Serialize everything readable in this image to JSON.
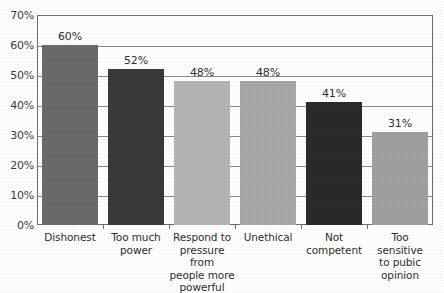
{
  "chart_data": {
    "type": "bar",
    "title": "",
    "xlabel": "",
    "ylabel": "",
    "ylim": [
      0,
      70
    ],
    "ytick_step": 10,
    "ytick_labels": [
      "0%",
      "10%",
      "20%",
      "30%",
      "40%",
      "50%",
      "60%",
      "70%"
    ],
    "ytick_values": [
      0,
      10,
      20,
      30,
      40,
      50,
      60,
      70
    ],
    "grid": true,
    "legend": "none",
    "value_label_suffix": "%",
    "categories": [
      "Dishonest",
      "Too much power",
      "Respond to pressure from people more powerful",
      "Unethical",
      "Not competent",
      "Too sensitive to pubic opinion"
    ],
    "category_lines": [
      [
        "Dishonest"
      ],
      [
        "Too much",
        "power"
      ],
      [
        "Respond to",
        "pressure from",
        "people more",
        "powerful"
      ],
      [
        "Unethical"
      ],
      [
        "Not",
        "competent"
      ],
      [
        "Too sensitive",
        "to pubic",
        "opinion"
      ]
    ],
    "values": [
      60,
      52,
      48,
      48,
      41,
      31
    ],
    "value_labels": [
      "60%",
      "52%",
      "48%",
      "48%",
      "41%",
      "31%"
    ],
    "bar_colors": [
      "#6b6b6b",
      "#3a3a3a",
      "#b5b5b5",
      "#a8a8a8",
      "#2b2b2b",
      "#a0a0a0"
    ],
    "axis_color": "#6e6e6e",
    "gridline_color": "#8a8a8a",
    "text_color": "#2f2f2f",
    "background": "#ffffff"
  }
}
